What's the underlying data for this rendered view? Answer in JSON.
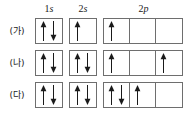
{
  "diagram": {
    "columns": [
      {
        "id": "1s",
        "shell": "1",
        "orbital_letter": "s",
        "box_count": 1
      },
      {
        "id": "2s",
        "shell": "2",
        "orbital_letter": "s",
        "box_count": 1
      },
      {
        "id": "2p",
        "shell": "2",
        "orbital_letter": "p",
        "box_count": 3
      }
    ],
    "rows": [
      {
        "label": "(가)",
        "orbitals": {
          "1s": [
            [
              "up",
              "down"
            ]
          ],
          "2s": [
            [
              "up"
            ]
          ],
          "2p": [
            [
              "up"
            ],
            [],
            []
          ]
        }
      },
      {
        "label": "(나)",
        "orbitals": {
          "1s": [
            [
              "up",
              "down"
            ]
          ],
          "2s": [
            [
              "up",
              "down"
            ]
          ],
          "2p": [
            [
              "up"
            ],
            [],
            [
              "up"
            ]
          ]
        }
      },
      {
        "label": "(다)",
        "orbitals": {
          "1s": [
            [
              "up",
              "down"
            ]
          ],
          "2s": [
            [
              "up",
              "down"
            ]
          ],
          "2p": [
            [
              "up",
              "down"
            ],
            [
              "up"
            ],
            []
          ]
        }
      }
    ],
    "colors": {
      "box_border": "#6e6e6e",
      "arrow": "#1a1a1a",
      "text": "#1a1a1a",
      "background": "#ffffff"
    }
  }
}
